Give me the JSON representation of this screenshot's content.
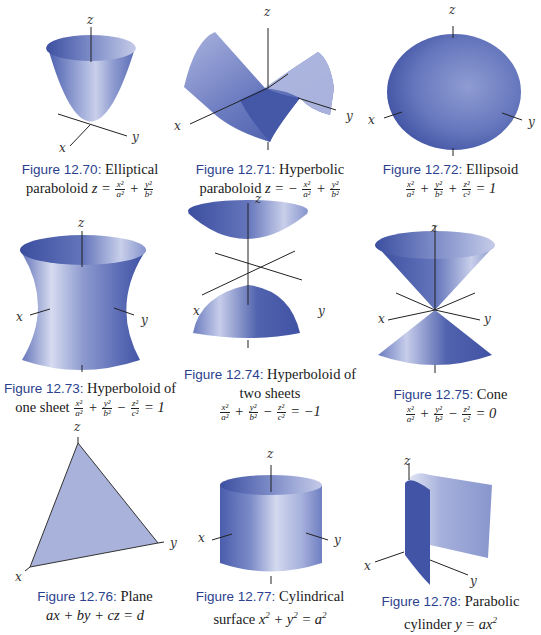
{
  "figures": [
    {
      "id": "12.70",
      "label": "Figure 12.70",
      "sep": ":",
      "caption_line1": "Elliptical",
      "caption_line2_text": "paraboloid",
      "equation": "z = x^2/a^2 + y^2/b^2",
      "eq": {
        "lhs": "z =",
        "t1": [
          "x²",
          "a²"
        ],
        "op1": "+",
        "t2": [
          "y²",
          "b²"
        ]
      },
      "axes": {
        "x": "x",
        "y": "y",
        "z": "z"
      }
    },
    {
      "id": "12.71",
      "label": "Figure 12.71",
      "sep": ":",
      "caption_line1": "Hyperbolic",
      "caption_line2_text": "paraboloid",
      "equation": "z = -x^2/a^2 + y^2/b^2",
      "eq": {
        "lhs": "z = −",
        "t1": [
          "x²",
          "a²"
        ],
        "op1": "+",
        "t2": [
          "y²",
          "b²"
        ]
      },
      "axes": {
        "x": "x",
        "y": "y",
        "z": "z"
      }
    },
    {
      "id": "12.72",
      "label": "Figure 12.72",
      "sep": ":",
      "caption_line1": "Ellipsoid",
      "equation": "x^2/a^2 + y^2/b^2 + z^2/c^2 = 1",
      "eq": {
        "t1": [
          "x²",
          "a²"
        ],
        "op1": "+",
        "t2": [
          "y²",
          "b²"
        ],
        "op2": "+",
        "t3": [
          "z²",
          "c²"
        ],
        "rhs": "= 1"
      },
      "axes": {
        "x": "x",
        "y": "y",
        "z": "z"
      }
    },
    {
      "id": "12.73",
      "label": "Figure 12.73",
      "sep": ":",
      "caption_line1": "Hyperboloid of",
      "caption_line2_text": "one sheet",
      "equation": "x^2/a^2 + y^2/b^2 - z^2/c^2 = 1",
      "eq": {
        "t1": [
          "x²",
          "a²"
        ],
        "op1": "+",
        "t2": [
          "y²",
          "b²"
        ],
        "op2": "−",
        "t3": [
          "z²",
          "c²"
        ],
        "rhs": "= 1"
      },
      "axes": {
        "x": "x",
        "y": "y",
        "z": "z"
      }
    },
    {
      "id": "12.74",
      "label": "Figure 12.74",
      "sep": ":",
      "caption_line1": "Hyperboloid of",
      "caption_line2_text": "two sheets",
      "equation": "x^2/a^2 + y^2/b^2 - z^2/c^2 = -1",
      "eq": {
        "t1": [
          "x²",
          "a²"
        ],
        "op1": "+",
        "t2": [
          "y²",
          "b²"
        ],
        "op2": "−",
        "t3": [
          "z²",
          "c²"
        ],
        "rhs": "= −1"
      },
      "axes": {
        "x": "x",
        "y": "y",
        "z": "z"
      }
    },
    {
      "id": "12.75",
      "label": "Figure 12.75",
      "sep": ":",
      "caption_line1": "Cone",
      "equation": "x^2/a^2 + y^2/b^2 - z^2/c^2 = 0",
      "eq": {
        "t1": [
          "x²",
          "a²"
        ],
        "op1": "+",
        "t2": [
          "y²",
          "b²"
        ],
        "op2": "−",
        "t3": [
          "z²",
          "c²"
        ],
        "rhs": "= 0"
      },
      "axes": {
        "x": "x",
        "y": "y",
        "z": "z"
      }
    },
    {
      "id": "12.76",
      "label": "Figure 12.76",
      "sep": ":",
      "caption_line1": "Plane",
      "equation": "ax + by + cz = d",
      "axes": {
        "x": "x",
        "y": "y",
        "z": "z"
      }
    },
    {
      "id": "12.77",
      "label": "Figure 12.77",
      "sep": ":",
      "caption_line1": "Cylindrical",
      "caption_line2_text": "surface",
      "equation": "x^2 + y^2 = a^2",
      "axes": {
        "x": "x",
        "y": "y",
        "z": "z"
      }
    },
    {
      "id": "12.78",
      "label": "Figure 12.78",
      "sep": ":",
      "caption_line1": "Parabolic",
      "caption_line2_text": "cylinder",
      "equation": "y = ax^2",
      "axes": {
        "x": "x",
        "y": "y",
        "z": "z"
      }
    }
  ],
  "colors": {
    "caption_label": "#2b3f8e",
    "surface_dark": "#3a4f9e",
    "surface_mid": "#7f8fc8",
    "surface_light": "#d9def0",
    "axis": "#222222"
  }
}
